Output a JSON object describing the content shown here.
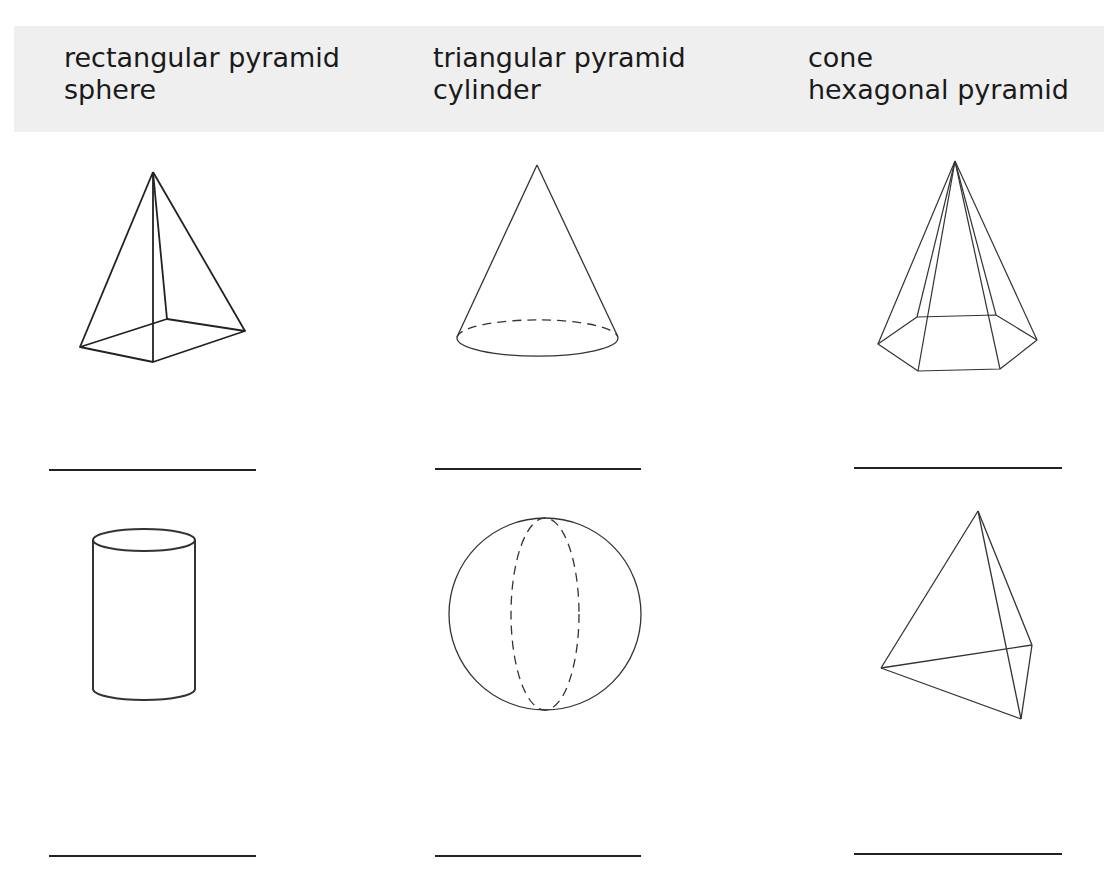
{
  "word_bank": {
    "columns": [
      [
        "rectangular pyramid",
        "sphere"
      ],
      [
        "triangular pyramid",
        "cylinder"
      ],
      [
        "cone",
        "hexagonal pyramid"
      ]
    ]
  },
  "shapes": [
    {
      "name": "rectangular-pyramid",
      "answer": ""
    },
    {
      "name": "cone",
      "answer": ""
    },
    {
      "name": "hexagonal-pyramid",
      "answer": ""
    },
    {
      "name": "cylinder",
      "answer": ""
    },
    {
      "name": "sphere",
      "answer": ""
    },
    {
      "name": "triangular-pyramid",
      "answer": ""
    }
  ],
  "colors": {
    "wordbank_bg": "#efefef",
    "line": "#222222"
  }
}
